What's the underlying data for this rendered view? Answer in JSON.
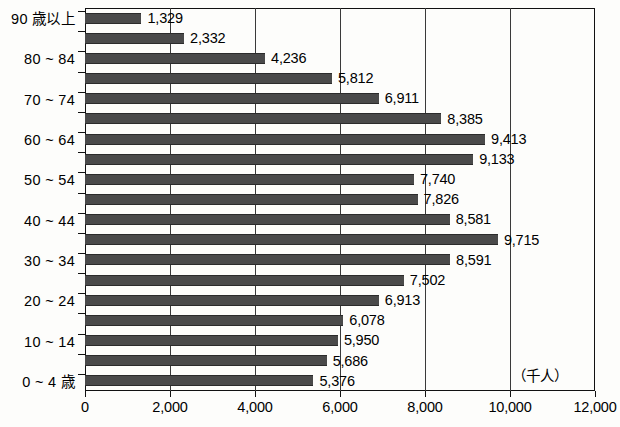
{
  "chart_data": {
    "type": "bar",
    "orientation": "horizontal",
    "title": "",
    "xlabel": "",
    "ylabel": "",
    "unit_note": "（千人）",
    "xlim": [
      0,
      12000
    ],
    "xticks": [
      0,
      2000,
      4000,
      6000,
      8000,
      10000,
      12000
    ],
    "xtick_labels": [
      "0",
      "2,000",
      "4,000",
      "6,000",
      "8,000",
      "10,000",
      "12,000"
    ],
    "grid": "vertical",
    "legend": "none",
    "bar_color": "#4a4a4a",
    "categories": [
      "90 歳以上",
      "85 ~ 89",
      "80 ~ 84",
      "75 ~ 79",
      "70 ~ 74",
      "65 ~ 69",
      "60 ~ 64",
      "55 ~ 59",
      "50 ~ 54",
      "45 ~ 49",
      "40 ~ 44",
      "35 ~ 39",
      "30 ~ 34",
      "25 ~ 29",
      "20 ~ 24",
      "15 ~ 19",
      "10 ~ 14",
      "5 ~ 9",
      "0 ~ 4 歳"
    ],
    "values": [
      1329,
      2332,
      4236,
      5812,
      6911,
      8385,
      9413,
      9133,
      7740,
      7826,
      8581,
      9715,
      8591,
      7502,
      6913,
      6078,
      5950,
      5686,
      5376
    ],
    "value_labels": [
      "1,329",
      "2,332",
      "4,236",
      "5,812",
      "6,911",
      "8,385",
      "9,413",
      "9,133",
      "7,740",
      "7,826",
      "8,581",
      "9,715",
      "8,591",
      "7,502",
      "6,913",
      "6,078",
      "5,950",
      "5,686",
      "5,376"
    ],
    "axis_labeled_categories": [
      "90 歳以上",
      "80 ~ 84",
      "70 ~ 74",
      "60 ~ 64",
      "50 ~ 54",
      "40 ~ 44",
      "30 ~ 34",
      "20 ~ 24",
      "10 ~ 14",
      "0 ~ 4 歳"
    ]
  }
}
